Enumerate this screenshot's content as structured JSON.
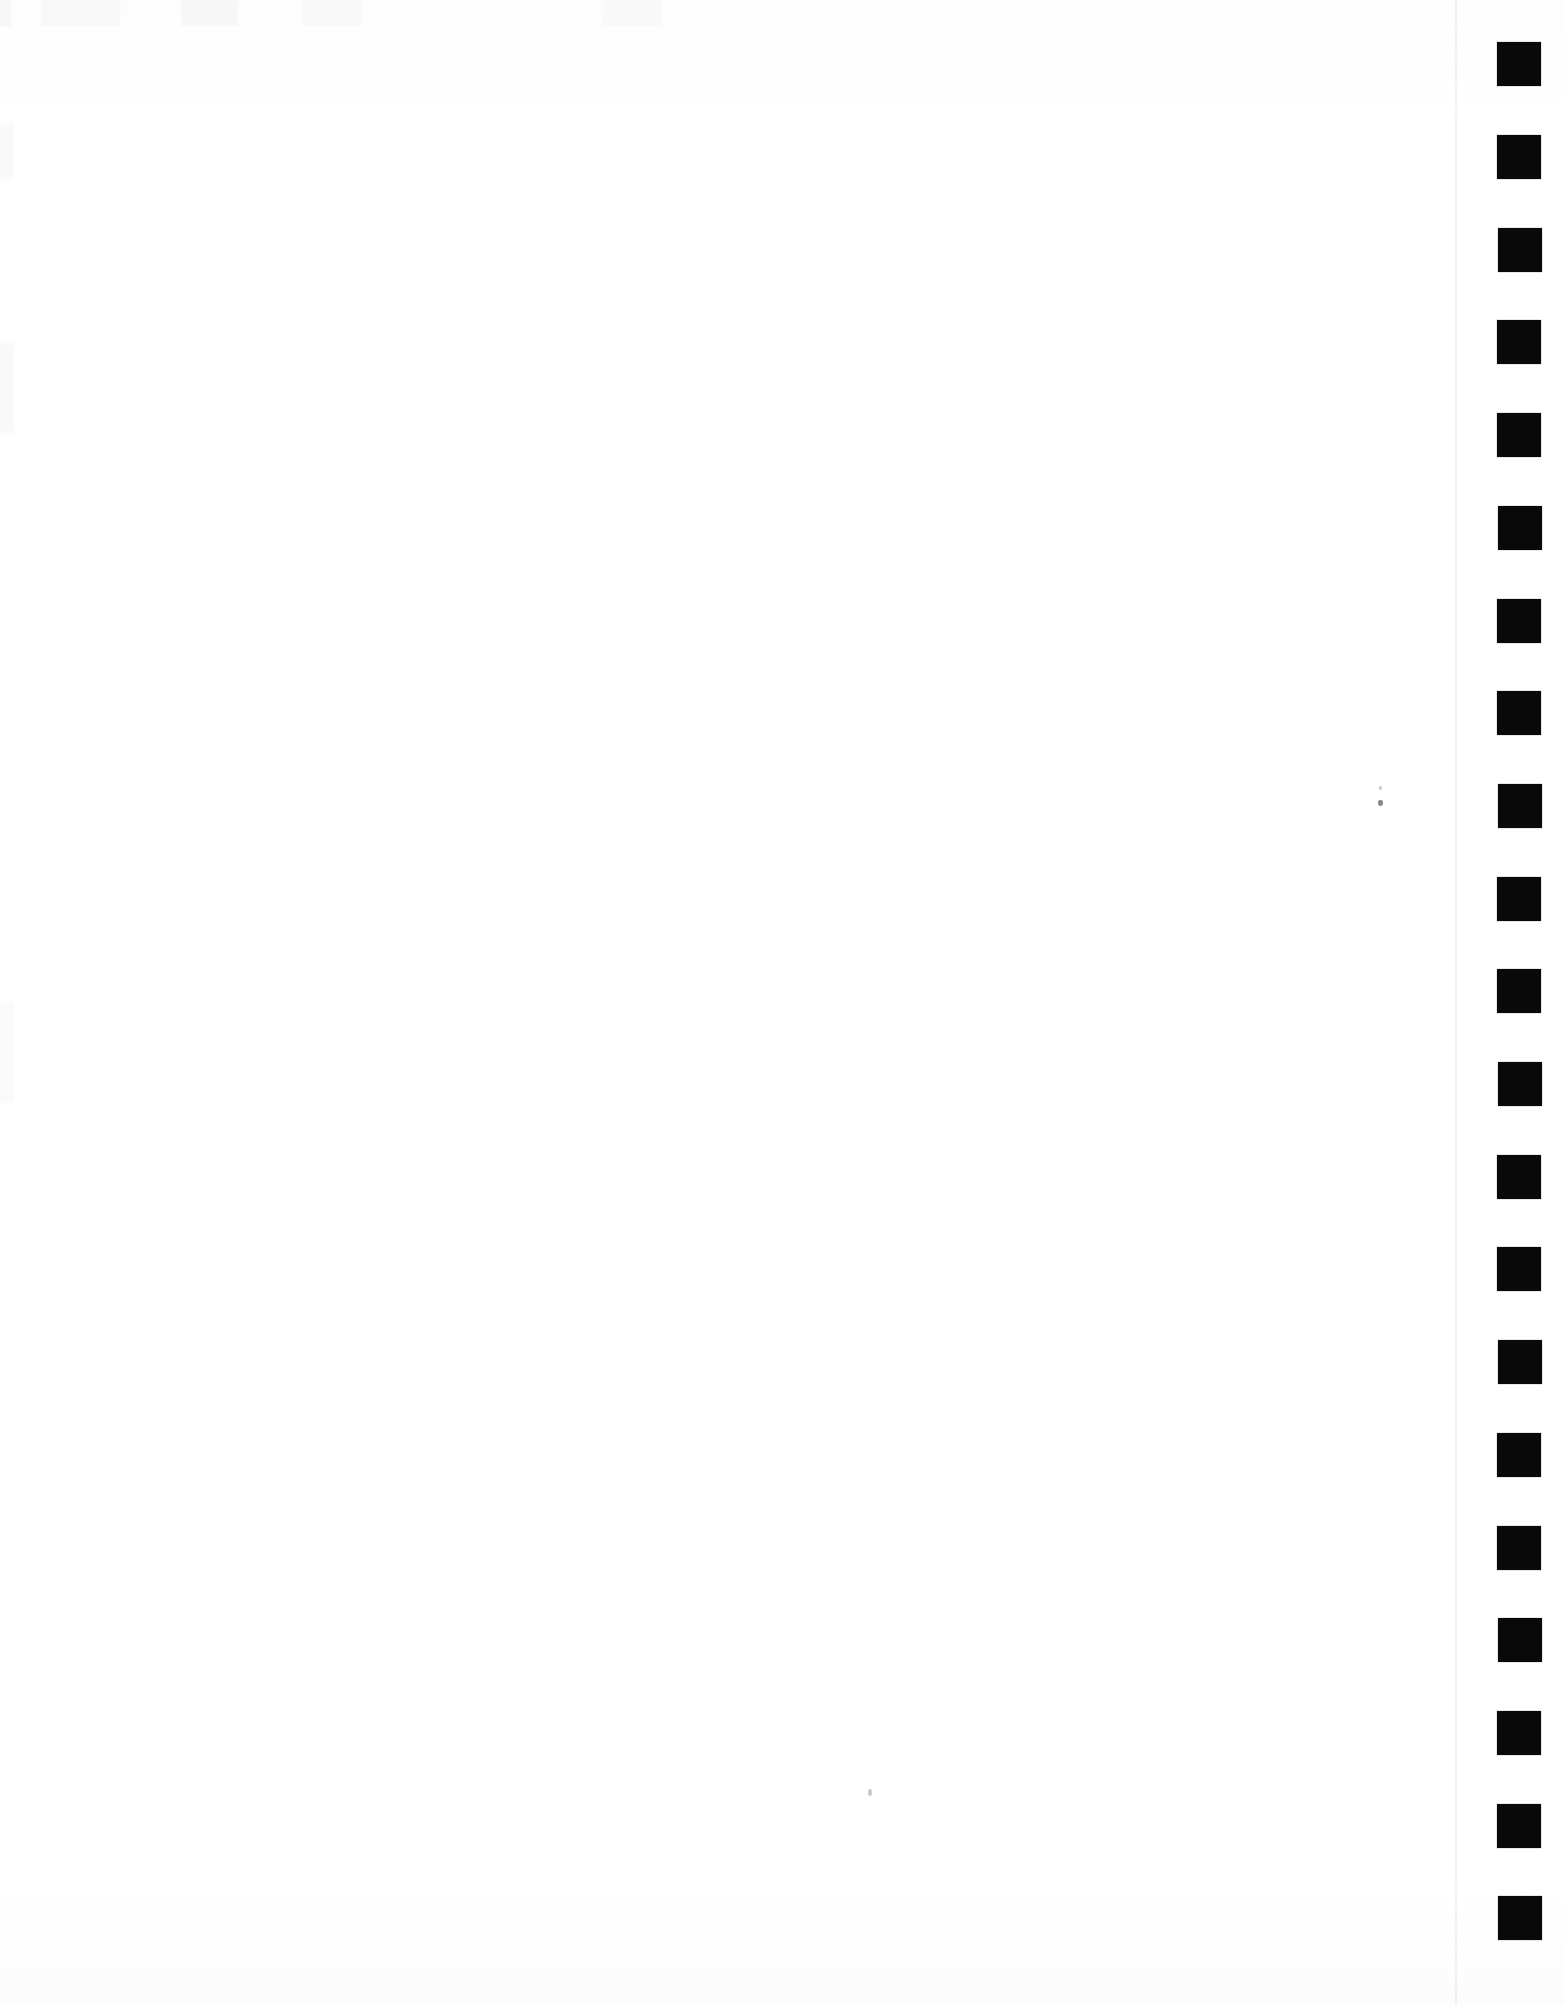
{
  "document": {
    "kind": "scanned-page",
    "title": "Scanned blank page with registration mark column",
    "page_width": 1565,
    "page_height": 2005,
    "background_color": "#ffffff",
    "body_text": "",
    "body_note": ""
  },
  "content_area": {
    "name": "blank-content-area",
    "text": "",
    "left": 0,
    "top": 0,
    "width": 1455,
    "height": 2005
  },
  "page_edge_line": {
    "x": 1455,
    "color": "#000000",
    "opacity": 0.045
  },
  "mark_column": {
    "label": "registration-mark-column",
    "left": 1496,
    "width": 48,
    "mark_color": "#090909",
    "mark_width": 44,
    "mark_height": 44,
    "pitch": 92.6,
    "count": 21,
    "marks": [
      {
        "index": 1,
        "x": 1497,
        "y": 42,
        "w": 44,
        "h": 44
      },
      {
        "index": 2,
        "x": 1497,
        "y": 135,
        "w": 44,
        "h": 44
      },
      {
        "index": 3,
        "x": 1498,
        "y": 228,
        "w": 44,
        "h": 44
      },
      {
        "index": 4,
        "x": 1497,
        "y": 320,
        "w": 44,
        "h": 44
      },
      {
        "index": 5,
        "x": 1497,
        "y": 413,
        "w": 44,
        "h": 44
      },
      {
        "index": 6,
        "x": 1498,
        "y": 506,
        "w": 44,
        "h": 44
      },
      {
        "index": 7,
        "x": 1497,
        "y": 599,
        "w": 44,
        "h": 44
      },
      {
        "index": 8,
        "x": 1497,
        "y": 691,
        "w": 44,
        "h": 44
      },
      {
        "index": 9,
        "x": 1498,
        "y": 784,
        "w": 44,
        "h": 44
      },
      {
        "index": 10,
        "x": 1497,
        "y": 877,
        "w": 44,
        "h": 44
      },
      {
        "index": 11,
        "x": 1497,
        "y": 969,
        "w": 44,
        "h": 44
      },
      {
        "index": 12,
        "x": 1498,
        "y": 1062,
        "w": 44,
        "h": 44
      },
      {
        "index": 13,
        "x": 1497,
        "y": 1155,
        "w": 44,
        "h": 44
      },
      {
        "index": 14,
        "x": 1497,
        "y": 1247,
        "w": 44,
        "h": 44
      },
      {
        "index": 15,
        "x": 1498,
        "y": 1340,
        "w": 44,
        "h": 44
      },
      {
        "index": 16,
        "x": 1497,
        "y": 1433,
        "w": 44,
        "h": 44
      },
      {
        "index": 17,
        "x": 1497,
        "y": 1526,
        "w": 44,
        "h": 44
      },
      {
        "index": 18,
        "x": 1498,
        "y": 1618,
        "w": 44,
        "h": 44
      },
      {
        "index": 19,
        "x": 1497,
        "y": 1711,
        "w": 44,
        "h": 44
      },
      {
        "index": 20,
        "x": 1497,
        "y": 1804,
        "w": 44,
        "h": 44
      },
      {
        "index": 21,
        "x": 1498,
        "y": 1896,
        "w": 44,
        "h": 44
      }
    ]
  },
  "specks": [
    {
      "name": "speck-upper-right",
      "x": 1378,
      "y": 800,
      "w": 5,
      "h": 6,
      "faint": false
    },
    {
      "name": "speck-upper-right-small",
      "x": 1379,
      "y": 786,
      "w": 3,
      "h": 4,
      "faint": true
    },
    {
      "name": "speck-lower-center",
      "x": 868,
      "y": 1789,
      "w": 4,
      "h": 7,
      "faint": true
    }
  ]
}
